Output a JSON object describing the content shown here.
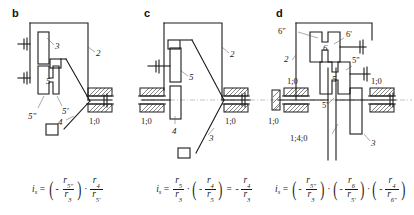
{
  "figure": {
    "caption_type": "kinematic-gear-train-schematics",
    "panels": [
      {
        "letter": "b",
        "labels": [
          "3",
          "2",
          "5",
          "5'",
          "5\"",
          "4",
          "1;0"
        ],
        "ground_marks": [
          "1;0"
        ],
        "formula": {
          "lhs": "i",
          "lhs_sub": "s",
          "terms": [
            {
              "sign": "-",
              "num": "r",
              "num_sub": "5\"",
              "den": "r",
              "den_sub": "3",
              "parens": true
            },
            {
              "sign": "",
              "num": "r",
              "num_sub": "4",
              "den": "r",
              "den_sub": "5'",
              "parens": false
            }
          ],
          "text": "i_s = ( - r_5\" / r_3 ) · r_4 / r_5'"
        }
      },
      {
        "letter": "c",
        "labels": [
          "5",
          "2",
          "4",
          "3",
          "1;0",
          "1;0"
        ],
        "ground_marks": [
          "1;0",
          "1;0"
        ],
        "formula": {
          "lhs": "i",
          "lhs_sub": "s",
          "terms": [
            {
              "sign": "",
              "num": "r",
              "num_sub": "5",
              "den": "r",
              "den_sub": "3",
              "parens": false
            },
            {
              "sign": "-",
              "num": "r",
              "num_sub": "4",
              "den": "r",
              "den_sub": "5",
              "parens": true
            }
          ],
          "result": {
            "sign": "-",
            "num": "r",
            "num_sub": "4",
            "den": "r",
            "den_sub": "3"
          },
          "text": "i_s = r_5 / r_3 · ( - r_4 / r_5 ) = - r_4 / r_3"
        }
      },
      {
        "letter": "d",
        "labels": [
          "6\"",
          "6'",
          "6",
          "2",
          "5\"",
          "5",
          "5'",
          "3",
          "1;0",
          "1;0",
          "1;0",
          "1;4;0"
        ],
        "ground_marks": [
          "1;0",
          "1;0",
          "1;0",
          "1;4;0"
        ],
        "formula": {
          "lhs": "i",
          "lhs_sub": "s",
          "terms": [
            {
              "sign": "-",
              "num": "r",
              "num_sub": "5\"",
              "den": "r",
              "den_sub": "3",
              "parens": true
            },
            {
              "sign": "-",
              "num": "r",
              "num_sub": "6",
              "den": "r",
              "den_sub": "5'",
              "parens": true
            },
            {
              "sign": "-",
              "num": "r",
              "num_sub": "4",
              "den": "r",
              "den_sub": "6\"",
              "parens": true
            }
          ],
          "text": "i_s = ( - r_5\" / r_3 ) · ( - r_6 / r_5' ) · ( - r_4 / r_6\" )"
        }
      }
    ],
    "symbols": {
      "multiply": "·",
      "equals": "=",
      "minus": "−",
      "paren_open": "(",
      "paren_close": ")"
    },
    "colors": {
      "line": "#1a1a1a",
      "axis": "#9a9a9a",
      "leader": "#555555",
      "background": "#ffffff"
    }
  }
}
